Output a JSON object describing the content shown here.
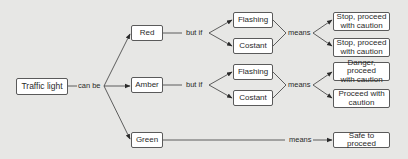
{
  "diagram": {
    "root": "Traffic light",
    "root_relation": "can be",
    "condition_relation": "but if",
    "meaning_relation": "means",
    "branches": [
      {
        "state": "Red",
        "conditions": [
          {
            "mode": "Flashing",
            "meaning": "Stop, proceed with caution",
            "meaning_line1": "Stop, proceed",
            "meaning_line2": "with caution"
          },
          {
            "mode": "Costant",
            "meaning": "Stop, proceed with caution",
            "meaning_line1": "Stop, proceed",
            "meaning_line2": "with caution"
          }
        ]
      },
      {
        "state": "Amber",
        "conditions": [
          {
            "mode": "Flashing",
            "meaning": "Danger, proceed with caution",
            "meaning_line1": "Danger, proceed",
            "meaning_line2": "with caution"
          },
          {
            "mode": "Costant",
            "meaning": "Proceed with caution",
            "meaning_line1": "Proceed with",
            "meaning_line2": "caution"
          }
        ]
      },
      {
        "state": "Green",
        "meaning": "Safe to proceed"
      }
    ]
  },
  "colors": {
    "background": "#e7e7e5",
    "box_fill": "#ffffff",
    "stroke": "#3a3a3a"
  }
}
